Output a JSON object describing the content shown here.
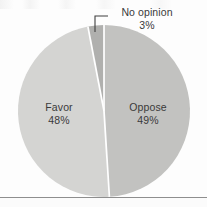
{
  "chart_data": {
    "type": "pie",
    "title": "",
    "subtitle": "",
    "xlabel": "",
    "ylabel": "",
    "legend_position": "none",
    "grid": false,
    "units": "percent",
    "categories": [
      "Oppose",
      "Favor",
      "No opinion"
    ],
    "values": [
      49,
      48,
      3
    ],
    "slices": [
      {
        "name": "Oppose",
        "label": "Oppose",
        "value": 49,
        "value_label": "49%",
        "color": "#c2c2c0",
        "label_placement": "inside"
      },
      {
        "name": "Favor",
        "label": "Favor",
        "value": 48,
        "value_label": "48%",
        "color": "#d4d4d2",
        "label_placement": "inside"
      },
      {
        "name": "No opinion",
        "label": "No opinion",
        "value": 3,
        "value_label": "3%",
        "color": "#b0b0ae",
        "label_placement": "outside-callout"
      }
    ],
    "start_angle_deg": 0,
    "direction": "clockwise",
    "separator_color": "#ffffff",
    "text_color": "#3a3a3a",
    "background_color": "#fdfdfd",
    "rule_color": "#8e8e8e"
  },
  "labels": {
    "favor": {
      "name": "Favor",
      "percent": "48%"
    },
    "oppose": {
      "name": "Oppose",
      "percent": "49%"
    },
    "no_opinion": {
      "name": "No opinion",
      "percent": "3%"
    }
  },
  "annotations": {
    "callout_target": "No opinion",
    "callout_shape": "elbow-leader-line"
  }
}
